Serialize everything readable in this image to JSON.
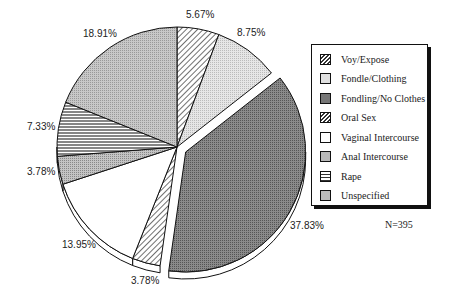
{
  "chart_data": {
    "type": "pie",
    "title": "",
    "categories": [
      "Voy/Expose",
      "Fondle/Clothing",
      "Fondling/No Clothes",
      "Oral Sex",
      "Vaginal Intercourse",
      "Anal Intercourse",
      "Rape",
      "Unspecified"
    ],
    "values": [
      5.67,
      8.75,
      37.83,
      3.78,
      13.95,
      3.78,
      7.33,
      18.91
    ],
    "value_labels": [
      "5.67%",
      "8.75%",
      "37.83%",
      "3.78%",
      "13.95%",
      "3.78%",
      "7.33%",
      "18.91%"
    ],
    "exploded": [
      "Fondling/No Clothes"
    ],
    "legend_position": "right",
    "annotation": "N=395"
  },
  "labels": {
    "voy": "5.67%",
    "fondle_clothing": "8.75%",
    "fondling_no_clothes": "37.83%",
    "oral": "3.78%",
    "vaginal": "13.95%",
    "anal": "3.78%",
    "rape": "7.33%",
    "unspecified": "18.91%"
  },
  "legend": {
    "items": [
      {
        "label": "Voy/Expose"
      },
      {
        "label": "Fondle/Clothing"
      },
      {
        "label": "Fondling/No Clothes"
      },
      {
        "label": "Oral Sex"
      },
      {
        "label": "Vaginal Intercourse"
      },
      {
        "label": "Anal Intercourse"
      },
      {
        "label": "Rape"
      },
      {
        "label": "Unspecified"
      }
    ]
  },
  "n_label": "N=395"
}
